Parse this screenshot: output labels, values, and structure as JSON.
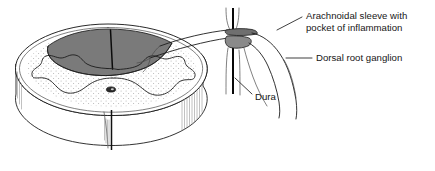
{
  "figure": {
    "kind": "medical-illustration",
    "background_color": "#ffffff",
    "ink_color": "#1d1d1d",
    "shade_color": "#7a7a7a",
    "stipple_color": "#a9a9a9"
  },
  "labels": [
    {
      "id": "arachnoidal-sleeve",
      "line1": "Arachnoidal sleeve with",
      "line2": "pocket of inflammation",
      "x": 306,
      "y1": 19,
      "y2": 31,
      "anchor": "start"
    },
    {
      "id": "dorsal-root-ganglion",
      "line1": "Dorsal root ganglion",
      "line2": "",
      "x": 316,
      "y1": 61,
      "y2": 0,
      "anchor": "start"
    },
    {
      "id": "dura",
      "line1": "Dura",
      "line2": "",
      "x": 255,
      "y1": 100,
      "y2": 0,
      "anchor": "start"
    }
  ],
  "leaders": [
    {
      "id": "leader-arachnoidal",
      "path": "M 302 17 L 277 30"
    },
    {
      "id": "leader-ganglion",
      "path": "M 312 58 L 286 58"
    },
    {
      "id": "leader-dura",
      "path": "M 252 94 L 235 78"
    }
  ],
  "anatomy": {
    "cord_disc": "spinal-cord-disc",
    "gray_matter": "butterfly-gray-matter",
    "dorsal_shading": "dorsal-columns-shaded",
    "central_canal": "central-canal",
    "ventral_fissure": "ventral-median-fissure",
    "nerve_root": "dorsal-nerve-root",
    "ganglion_body": "dorsal-root-ganglion-body",
    "dura_sheath": "dura-sheath",
    "sleeve_pocket": "arachnoidal-sleeve-pocket"
  }
}
